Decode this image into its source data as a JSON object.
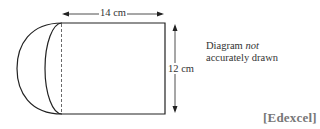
{
  "diagram": {
    "shape": "rectangle with semicircle attached on left side",
    "width_label": "14 cm",
    "height_label": "12 cm",
    "note_line1_prefix": "Diagram ",
    "note_emphasis": "not",
    "note_line2": "accurately drawn",
    "source": "[Edexcel]"
  }
}
